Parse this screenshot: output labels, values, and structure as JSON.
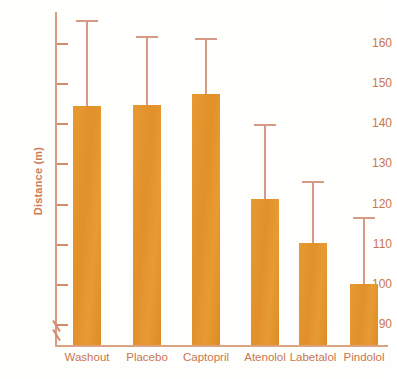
{
  "chart_data": {
    "type": "bar",
    "title": "",
    "xlabel": "",
    "ylabel": "Distance (m)",
    "categories": [
      "Washout",
      "Placebo",
      "Captopril",
      "Atenolol",
      "Labetalol",
      "Pindolol"
    ],
    "values": [
      144.6,
      144.7,
      147.6,
      121.5,
      110.3,
      100.3
    ],
    "errors_upper": [
      166.0,
      162.0,
      161.5,
      140.0,
      126.0,
      117.0
    ],
    "series": [
      {
        "name": "Distance",
        "values": [
          144.6,
          144.7,
          147.6,
          121.5,
          110.3,
          100.3
        ]
      }
    ],
    "ylim": [
      85,
      168
    ],
    "yticks": [
      90,
      100,
      110,
      120,
      130,
      140,
      150,
      160
    ],
    "ytick_labels": [
      "90",
      "100",
      "110",
      "120",
      "130",
      "140",
      "150",
      "160"
    ],
    "grid": false,
    "legend": null,
    "axis_break": true,
    "error_bar_style": "upper-only-with-cap",
    "colors": {
      "bar": "#e6962c",
      "error_bar": "#d79b85",
      "axis": "#d99a82",
      "tick_text": "#c9764e",
      "axis_label": "#cf7b55",
      "background": "#fefefc"
    }
  },
  "axis": {
    "break_symbol": "//"
  }
}
